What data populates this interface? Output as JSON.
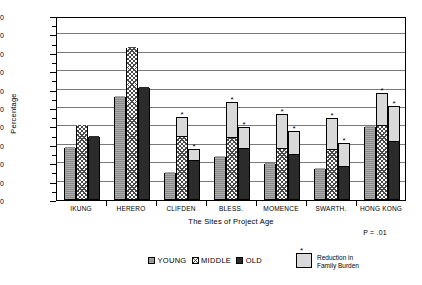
{
  "chart_data": {
    "type": "bar",
    "title": "",
    "xlabel": "The Sites of Project Age",
    "ylabel": "Percentage",
    "ylim": [
      0,
      100
    ],
    "ytick_step": 10,
    "yticks": [
      "0",
      "10",
      "20",
      "30",
      "40",
      "50",
      "60",
      "70",
      "80",
      "90",
      "100"
    ],
    "grid": true,
    "legend_position": "bottom",
    "annotation": "P = .01",
    "categories": [
      "IKUNG",
      "HERERO",
      "CLIFDEN",
      "BLESS.",
      "MOMENCE",
      "SWARTH.",
      "HONG KONG"
    ],
    "series": [
      {
        "name": "YOUNG",
        "values": [
          28.5,
          56,
          14.5,
          23.5,
          19.5,
          17,
          39.5
        ],
        "reduction_tops": [
          null,
          null,
          null,
          null,
          null,
          null,
          null
        ]
      },
      {
        "name": "MIDDLE",
        "values": [
          40,
          82.5,
          35,
          34,
          28.5,
          27.5,
          41
        ],
        "reduction_tops": [
          null,
          null,
          45,
          53,
          47,
          44.5,
          58
        ]
      },
      {
        "name": "OLD",
        "values": [
          34,
          61,
          22,
          28.5,
          25,
          18.5,
          32
        ],
        "reduction_tops": [
          null,
          null,
          27.5,
          39.5,
          37.5,
          31,
          51
        ]
      }
    ],
    "overlay_series": {
      "name": "Reduction in Family Burden",
      "marker": "*"
    }
  },
  "legend": {
    "items": [
      {
        "label": "YOUNG"
      },
      {
        "label": "MIDDLE"
      },
      {
        "label": "OLD"
      }
    ],
    "reduction": {
      "line1": "Reduction in",
      "line2": "Family Burden",
      "star": "*"
    }
  },
  "colors": {
    "young": "#8a8a8a",
    "middle": "#ffffff",
    "old": "#2b2b2b",
    "reduction": "#d9d9d9",
    "axis": "#000000",
    "grid": "#7a7a7a",
    "background": "#ffffff"
  }
}
